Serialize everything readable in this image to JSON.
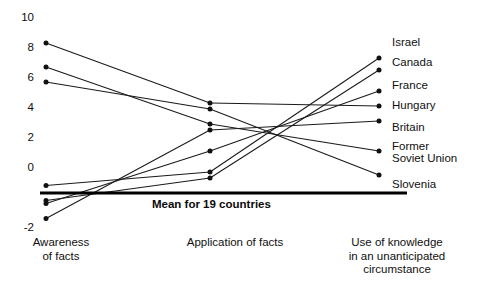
{
  "chart_data": {
    "type": "line",
    "subtype": "slopegraph",
    "title": "",
    "subtitle": "",
    "xlabel": "",
    "ylabel": "",
    "grid": false,
    "legend_position": "right-labels",
    "categories": [
      "Awareness\nof facts",
      "Application of facts",
      "Use of knowledge\nin an unanticipated\ncircumstance"
    ],
    "x_positions": [
      0,
      1,
      2
    ],
    "ylim": [
      -2,
      10
    ],
    "yticks": [
      -2,
      0,
      2,
      4,
      6,
      8,
      10
    ],
    "ytick_labels": [
      "-2",
      "0",
      "2",
      "4",
      "6",
      "8",
      "10"
    ],
    "reference_line": {
      "value": 0,
      "label": "Mean for 19 countries",
      "style": "thick-solid"
    },
    "series": [
      {
        "name": "Israel",
        "values": [
          0.5,
          1.4,
          9.0
        ]
      },
      {
        "name": "Canada",
        "values": [
          -0.5,
          1.0,
          8.2
        ]
      },
      {
        "name": "France",
        "values": [
          -0.7,
          2.8,
          6.8
        ]
      },
      {
        "name": "Hungary",
        "values": [
          10.0,
          6.0,
          5.8
        ]
      },
      {
        "name": "Britain",
        "values": [
          -1.7,
          4.2,
          4.8
        ]
      },
      {
        "name": "Former\nSoviet Union",
        "values": [
          8.4,
          4.6,
          2.8
        ]
      },
      {
        "name": "Slovenia",
        "values": [
          7.4,
          5.6,
          1.2
        ]
      }
    ]
  },
  "style": {
    "line_color": "#1a1a1a",
    "marker_color": "#111111",
    "text_color": "#101010",
    "mean_line_color": "#000000",
    "background": "#ffffff"
  },
  "axis": {
    "tick_labels": [
      "10",
      "8",
      "6",
      "4",
      "2",
      "0",
      "-2"
    ]
  },
  "labels": {
    "series_right": [
      "Israel",
      "Canada",
      "France",
      "Hungary",
      "Britain",
      "Former\nSoviet Union",
      "Slovenia"
    ],
    "columns": [
      "Awareness\nof facts",
      "Application of facts",
      "Use of knowledge\nin an unanticipated\ncircumstance"
    ],
    "mean_line": "Mean for 19 countries"
  }
}
